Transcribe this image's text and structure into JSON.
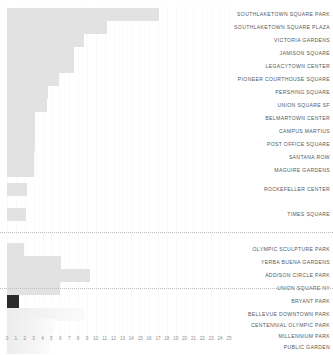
{
  "chart_data": {
    "type": "bar",
    "orientation": "horizontal",
    "title": "",
    "xlabel": "",
    "ylabel": "",
    "xlim": [
      0,
      25
    ],
    "grid": true,
    "legend": null,
    "tick_labels": [
      "0",
      "1",
      "2",
      "3",
      "4",
      "5",
      "6",
      "7",
      "8",
      "9",
      "10",
      "11",
      "12",
      "13",
      "14",
      "15",
      "16",
      "17",
      "18",
      "19",
      "20",
      "21",
      "22",
      "23",
      "24",
      "25"
    ],
    "highlight_color": "#2b2b2b",
    "bar_color": "#e2e2e2",
    "highlighted_category": "BRYANT PARK",
    "categories": [
      "SOUTHLAKETOWN SQUARE PARK",
      "SOUTHLAKETOWN SQUARE PLAZA",
      "VICTORIA GARDENS",
      "JAMISON SQUARE",
      "LEGACYTOWN CENTER",
      "PIONEER COURTHOUSE SQUARE",
      "PERSHING SQUARE",
      "UNION SQUARE SF",
      "BELMARTOWN CENTER",
      "CAMPUS MARTIUS",
      "POST OFFICE SQUARE",
      "SANTANA ROW",
      "MAGUIRE GARDENS",
      "ROCKEFELLER CENTER",
      "TIMES SQUARE",
      "OLYMPIC SCULPTURE PARK",
      "YERBA BUENA GARDENS",
      "ADDISON CIRCLE PARK",
      "UNION SQUARE NY",
      "BRYANT PARK",
      "BELLEVUE DOWNTOWN PARK",
      "CENTENNIAL OLYMPIC PARK",
      "MILLENNIUM PARK",
      "PUBLIC GARDEN"
    ],
    "values": [
      17.1,
      11.3,
      8.7,
      7.6,
      7.6,
      5.9,
      4.6,
      4.5,
      3.2,
      3.1,
      3.1,
      3.0,
      3.0,
      2.2,
      2.1,
      1.9,
      6.1,
      9.4,
      6.0,
      1.4,
      8.8,
      5.4,
      5.2,
      4.8
    ],
    "separators_after": [
      "OLYMPIC SCULPTURE PARK_before",
      "BRYANT PARK"
    ]
  }
}
